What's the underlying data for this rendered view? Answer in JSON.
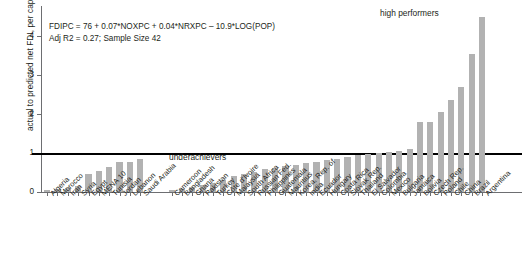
{
  "chart_data": {
    "type": "bar",
    "title": "",
    "xlabel": "",
    "ylabel": "actual to predicted net FDI, per capita US$",
    "ylim": [
      0,
      4.8
    ],
    "yticks": [
      0,
      1,
      2,
      3,
      4
    ],
    "ytick_labels": [
      "0",
      "1",
      "2",
      "3",
      "4"
    ],
    "grid": false,
    "legend": "none",
    "reference_line": {
      "value": 1,
      "label": "",
      "color": "#000000"
    },
    "annotations": [
      {
        "text": "high performers",
        "x_rel": 0.72,
        "y_rel": 0.93
      },
      {
        "text": "underachievers",
        "x_rel": 0.3,
        "y_rel": 0.2
      },
      {
        "text": "FDIPC = 76 + 0.07*NOXPC + 0.04*NRXPC – 10.9*LOG(POP)",
        "x_rel": 0.02,
        "y_rel": 0.88
      },
      {
        "text": "Adj R2 = 0.27; Sample Size 42",
        "x_rel": 0.02,
        "y_rel": 0.82
      }
    ],
    "equation_lines": [
      "FDIPC = 76 + 0.07*NOXPC + 0.04*NRXPC – 10.9*LOG(POP)",
      "Adj R2 = 0.27; Sample Size 42"
    ],
    "groups": [
      {
        "name": "MENA",
        "start": 0,
        "end": 9
      },
      {
        "name": "Comparators",
        "start": 10,
        "end": 41
      }
    ],
    "categories": [
      "Algeria",
      "Morocco",
      "Iran",
      "Syria",
      "Egypt",
      "MENA 10",
      "Tunisia",
      "Jordan",
      "Lebanon",
      "Saudi Arabia",
      "Cameroon",
      "Bangladesh",
      "Ghana",
      "Pakistan",
      "Turkey",
      "Côte d'Ivoire",
      "Malaysia",
      "South Africa",
      "Russian Fed.",
      "Philippines",
      "Guatemala",
      "Mauritius",
      "Korea, Rep. of",
      "India",
      "Ecuador",
      "Hungary",
      "Costa Rica",
      "Slovak Rep.",
      "Thailand",
      "El Salvador",
      "Colombia",
      "Mexico",
      "Bulgaria",
      "Jamaica",
      "Bolivia",
      "Czech Rep.",
      "Poland",
      "Chile",
      "China",
      "Brazil",
      "Argentina"
    ],
    "values": [
      0.04,
      0.07,
      0.1,
      0.16,
      0.46,
      0.55,
      0.63,
      0.78,
      0.77,
      0.86,
      0.05,
      0.09,
      0.13,
      0.17,
      0.23,
      0.3,
      0.4,
      0.47,
      0.52,
      0.58,
      0.62,
      0.67,
      0.7,
      0.74,
      0.78,
      0.82,
      0.86,
      0.9,
      0.94,
      0.97,
      1.0,
      1.03,
      1.06,
      1.1,
      1.8,
      1.8,
      2.05,
      2.35,
      2.7,
      3.55,
      4.5
    ],
    "bar_color": "#b2b2b2",
    "axis_color": "#6d6e71",
    "text_color": "#231f20",
    "overflow_bar": {
      "index": 41,
      "clipped": true,
      "note": "Argentina bar extends past top of plot"
    }
  }
}
